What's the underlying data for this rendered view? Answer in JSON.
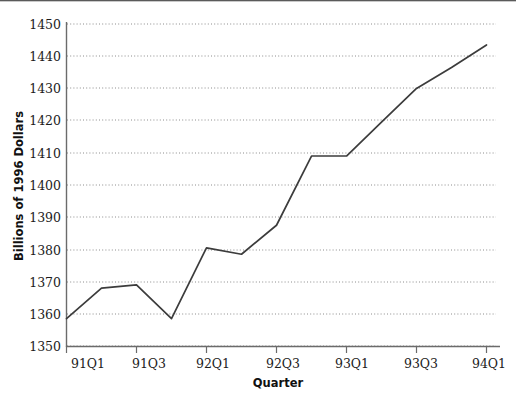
{
  "chart_data": {
    "type": "line",
    "title": "",
    "subtitle": "",
    "xlabel": "Quarter",
    "ylabel": "Billions of 1996 Dollars",
    "categories": [
      "91Q1",
      "91Q2",
      "91Q3",
      "91Q4",
      "92Q1",
      "92Q2",
      "92Q3",
      "92Q4",
      "93Q1",
      "93Q2",
      "93Q3",
      "93Q4",
      "94Q1"
    ],
    "x": [
      "91Q1",
      "91Q2",
      "91Q3",
      "91Q4",
      "92Q1",
      "92Q2",
      "92Q3",
      "92Q4",
      "93Q1",
      "93Q2",
      "93Q3",
      "93Q4",
      "94Q1"
    ],
    "values": [
      1358.5,
      1368.0,
      1369.0,
      1358.5,
      1380.5,
      1378.5,
      1387.5,
      1409.0,
      1409.0,
      1419.5,
      1430.0,
      1436.5,
      1443.5
    ],
    "series": [
      {
        "name": "Real Consumption Expenditures",
        "values": [
          1358.5,
          1368.0,
          1369.0,
          1358.5,
          1380.5,
          1378.5,
          1387.5,
          1409.0,
          1409.0,
          1419.5,
          1430.0,
          1436.5,
          1443.5
        ]
      }
    ],
    "ylim": [
      1350,
      1450
    ],
    "xlim": [
      "91Q1",
      "94Q1"
    ],
    "yticks": [
      1350,
      1360,
      1370,
      1380,
      1390,
      1400,
      1410,
      1420,
      1430,
      1440,
      1450
    ],
    "ytick_labels": [
      "1350",
      "1360",
      "1370",
      "1380",
      "1390",
      "1400",
      "1410",
      "1420",
      "1430",
      "1440",
      "1450"
    ],
    "xticks": [
      "91Q1",
      "91Q3",
      "92Q1",
      "92Q3",
      "93Q1",
      "93Q3",
      "94Q1"
    ],
    "xtick_labels": [
      "91Q1",
      "91Q3",
      "92Q1",
      "92Q3",
      "93Q1",
      "93Q3",
      "94Q1"
    ],
    "grid": "horizontal-dotted",
    "legend": "none",
    "line_color": "#3c3c3c",
    "grid_color": "#8c8c8c",
    "axis_color": "#6b6b6b",
    "background": "#ffffff"
  },
  "axes": {
    "y_title": "Billions of 1996 Dollars",
    "x_title": "Quarter"
  },
  "y_labels": {
    "l0": "1350",
    "l1": "1360",
    "l2": "1370",
    "l3": "1380",
    "l4": "1390",
    "l5": "1400",
    "l6": "1410",
    "l7": "1420",
    "l8": "1430",
    "l9": "1440",
    "l10": "1450"
  },
  "x_labels": {
    "t0": "91Q1",
    "t1": "91Q3",
    "t2": "92Q1",
    "t3": "92Q3",
    "t4": "93Q1",
    "t5": "93Q3",
    "t6": "94Q1"
  }
}
